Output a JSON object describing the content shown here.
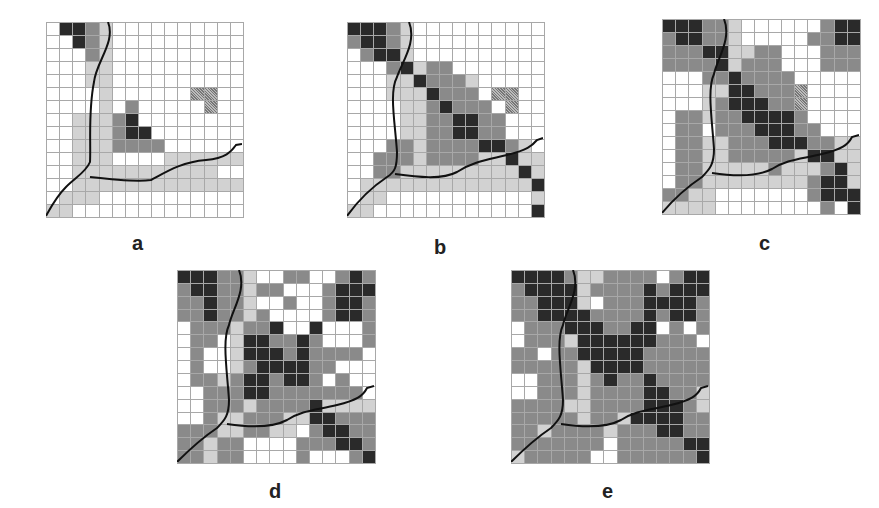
{
  "figure": {
    "legend_codes": {
      "0": "white",
      "1": "light-gray",
      "2": "mid-gray",
      "3": "dark",
      "4": "hatched"
    },
    "panels": [
      {
        "label": "a",
        "grid": [
          "033210000000000",
          "003210000000000",
          "000210000000000",
          "000110000000000",
          "000110000000000",
          "000010000004400",
          "000010200000400",
          "001112300000000",
          "001112330000000",
          "001112222000000",
          "001110000111111",
          "001111111111100",
          "001111111111111",
          "011100000000000",
          "110000000000000"
        ]
      },
      {
        "label": "b",
        "grid": [
          "333210000000000",
          "233210000000000",
          "023310000000000",
          "000231220000000",
          "000113222100000",
          "000111322204400",
          "000011232220400",
          "000011223322000",
          "000011223322000",
          "000221222233210",
          "002221222211311",
          "002211111111131",
          "011111111111113",
          "011000000000001",
          "110000000000003"
        ]
      },
      {
        "label": "c",
        "grid": [
          "333221000000233",
          "233221000002233",
          "222331122000222",
          "222231222000222",
          "000223222200000",
          "000113322240000",
          "000123332240000",
          "022122333320000",
          "022022233322000",
          "022112223332211",
          "022112222213311",
          "022111112111231",
          "022111111112331",
          "221100000002333",
          "111100000000203"
        ]
      },
      {
        "label": "d",
        "grid": [
          "333221002200232",
          "233221220002333",
          "223221002002332",
          "223221200002332",
          "022212230030002",
          "022013322320002",
          "020013332322220",
          "020012333322000",
          "022123323320200",
          "002223322222220",
          "002221222231111",
          "002112221133222",
          "222112211023322",
          "221220000222332",
          "221220000200023"
        ]
      },
      {
        "label": "e",
        "grid": [
          "333321122220233",
          "233331222232333",
          "223331022233332",
          "223333222232332",
          "022233322330202",
          "022213333332220",
          "220223333322222",
          "222221333322222",
          "002221232232222",
          "002221222233221",
          "222211222233321",
          "222221221333322",
          "221222212223322",
          "222222202222233",
          "122222002222223"
        ]
      }
    ]
  }
}
